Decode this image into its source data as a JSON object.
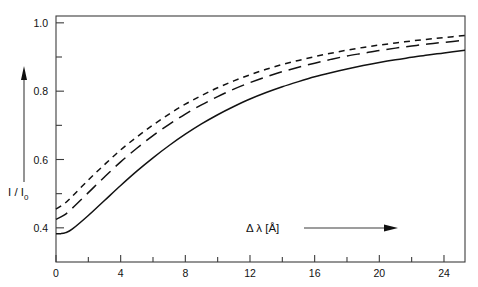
{
  "chart_data": {
    "type": "line",
    "title": "",
    "subtitle": "",
    "xlabel": "Δ λ [Å]",
    "ylabel": "I / I",
    "ylabel_sub": "0",
    "xlim": [
      0,
      25.3
    ],
    "ylim": [
      0.3,
      1.02
    ],
    "grid": false,
    "legend_position": "none",
    "x_ticks_major": [
      0,
      4,
      8,
      12,
      16,
      20,
      24
    ],
    "x_tick_labels": [
      "0",
      "4",
      "8",
      "12",
      "16",
      "20",
      "24"
    ],
    "x_ticks_minor": [
      2,
      6,
      10,
      14,
      18,
      22
    ],
    "y_ticks_major": [
      0.4,
      0.6,
      0.8,
      1.0
    ],
    "y_tick_labels": [
      "0.4",
      "0.6",
      "0.8",
      "1.0"
    ],
    "y_ticks_minor": [
      0.5,
      0.7,
      0.9
    ],
    "annotations": [
      {
        "name": "y-axis-arrow",
        "text": "",
        "direction": "up"
      },
      {
        "name": "x-axis-arrow",
        "text": "",
        "direction": "right"
      }
    ],
    "series": [
      {
        "name": "upper-curve",
        "style": "short-dashed",
        "dash": "6,5",
        "x": [
          0,
          0.5,
          1,
          2,
          3,
          4,
          5,
          6,
          7,
          8,
          9,
          10,
          11,
          12,
          13,
          14,
          15,
          16,
          17,
          18,
          19,
          20,
          21,
          22,
          23,
          24,
          25.3
        ],
        "y": [
          0.455,
          0.47,
          0.492,
          0.54,
          0.585,
          0.628,
          0.666,
          0.701,
          0.733,
          0.762,
          0.787,
          0.81,
          0.83,
          0.848,
          0.864,
          0.878,
          0.89,
          0.901,
          0.911,
          0.92,
          0.928,
          0.935,
          0.941,
          0.947,
          0.952,
          0.957,
          0.963
        ]
      },
      {
        "name": "middle-curve",
        "style": "long-dashed",
        "dash": "13,7",
        "x": [
          0,
          0.5,
          1,
          2,
          3,
          4,
          5,
          6,
          7,
          8,
          9,
          10,
          11,
          12,
          13,
          14,
          15,
          16,
          17,
          18,
          19,
          20,
          21,
          22,
          23,
          24,
          25.3
        ],
        "y": [
          0.425,
          0.437,
          0.457,
          0.503,
          0.549,
          0.593,
          0.633,
          0.67,
          0.703,
          0.733,
          0.76,
          0.784,
          0.806,
          0.825,
          0.842,
          0.857,
          0.87,
          0.882,
          0.893,
          0.903,
          0.911,
          0.919,
          0.926,
          0.932,
          0.938,
          0.943,
          0.949
        ]
      },
      {
        "name": "lower-curve",
        "style": "solid",
        "dash": "",
        "x": [
          0,
          0.3,
          0.6,
          1,
          2,
          3,
          4,
          5,
          6,
          7,
          8,
          9,
          10,
          11,
          12,
          13,
          14,
          15,
          16,
          17,
          18,
          19,
          20,
          21,
          22,
          23,
          24,
          25.3
        ],
        "y": [
          0.383,
          0.383,
          0.386,
          0.396,
          0.436,
          0.48,
          0.524,
          0.566,
          0.605,
          0.641,
          0.674,
          0.704,
          0.731,
          0.755,
          0.777,
          0.796,
          0.813,
          0.828,
          0.842,
          0.854,
          0.865,
          0.875,
          0.884,
          0.892,
          0.899,
          0.906,
          0.912,
          0.92
        ]
      }
    ]
  }
}
